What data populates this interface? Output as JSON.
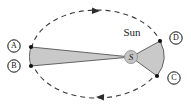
{
  "figure": {
    "background_color": "#ffffff"
  },
  "colors": {
    "orbit_stroke": "#3a3a3a",
    "sector_fill": "#c9c9c9",
    "sector_stroke": "#555555",
    "point_fill": "#111111",
    "label_ring_stroke": "#111111",
    "label_text": "#111111",
    "sun_text": "#222222",
    "sun_disc_fill": "#c4c4c4",
    "sun_disc_stroke": "#8e8e8e"
  },
  "orbit": {
    "shape": "ellipse",
    "style": "dashed",
    "center_x": 97,
    "center_y": 54,
    "radius_x": 66,
    "radius_y": 44,
    "dash_pattern": "5 4",
    "stroke_width": 1.1
  },
  "sun": {
    "label": "Sun",
    "label_x": 132,
    "label_y": 33,
    "label_font_size": 11,
    "focus_marker_label": "S",
    "focus_x": 131,
    "focus_y": 57,
    "focus_radius": 6.5,
    "focus_font_size": 9
  },
  "points": [
    {
      "id": "A",
      "label": "A",
      "x": 31,
      "y": 47,
      "label_x": 14,
      "label_y": 46
    },
    {
      "id": "B",
      "label": "B",
      "x": 31,
      "y": 66,
      "label_x": 14,
      "label_y": 66
    },
    {
      "id": "C",
      "label": "C",
      "x": 157,
      "y": 76,
      "label_x": 174,
      "label_y": 78
    },
    {
      "id": "D",
      "label": "D",
      "x": 160,
      "y": 41,
      "label_x": 176,
      "label_y": 38
    }
  ],
  "sectors": [
    {
      "name": "sector-SAB",
      "description": "Equal-area swept sector from S to A to B at aphelion side",
      "vertices": "131,57 31,47 31,66",
      "arc_to": "31,66"
    },
    {
      "name": "sector-SCD",
      "description": "Equal-area swept sector from S to D to C at perihelion side",
      "vertices": "131,57 160,41 157,76",
      "arc_to": "157,76"
    }
  ],
  "direction_arrows": [
    {
      "name": "orbit-arrow-top",
      "x": 100,
      "y": 11,
      "rotation": 182,
      "direction": "leftward"
    },
    {
      "name": "orbit-arrow-bottom",
      "x": 96,
      "y": 97,
      "rotation": 2,
      "direction": "rightward"
    }
  ],
  "label_circle": {
    "radius": 6.2,
    "stroke_width": 1,
    "font_size": 8
  }
}
